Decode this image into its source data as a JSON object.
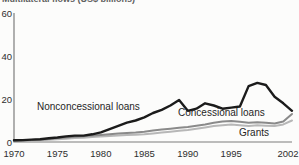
{
  "chart_data": {
    "type": "line",
    "title": "Multilateral flows (US$ billions)",
    "xlabel": "",
    "ylabel": "",
    "xlim": [
      1970,
      2002
    ],
    "ylim": [
      0,
      60
    ],
    "grid": false,
    "legend_position": "inline-labels",
    "axis_color": "#7d7d7d",
    "x_tick_years": [
      1970,
      1975,
      1980,
      1985,
      1990,
      1995,
      2002
    ],
    "x_tick_labels": [
      "1970",
      "1975",
      "1980",
      "1985",
      "1990",
      "1995",
      "2002"
    ],
    "y_tick_values": [
      0,
      20,
      40,
      60
    ],
    "y_tick_labels": [
      "0",
      "20",
      "40",
      "60"
    ],
    "x": [
      1970,
      1971,
      1972,
      1973,
      1974,
      1975,
      1976,
      1977,
      1978,
      1979,
      1980,
      1981,
      1982,
      1983,
      1984,
      1985,
      1986,
      1987,
      1988,
      1989,
      1990,
      1991,
      1992,
      1993,
      1994,
      1995,
      1996,
      1997,
      1998,
      1999,
      2000,
      2001,
      2002
    ],
    "series": [
      {
        "name": "Nonconcessional loans",
        "color": "#1b1b1b",
        "values": [
          0.8,
          0.9,
          1.1,
          1.3,
          1.7,
          2.1,
          2.6,
          3.0,
          3.0,
          3.6,
          4.5,
          6.0,
          7.5,
          9.0,
          10.0,
          11.5,
          13.5,
          15.0,
          17.0,
          19.5,
          14.5,
          15.5,
          18.0,
          17.0,
          15.5,
          16.0,
          16.5,
          26.0,
          27.5,
          26.5,
          21.0,
          18.0,
          14.5
        ]
      },
      {
        "name": "Concessional loans",
        "color": "#8a8a8a",
        "values": [
          0.5,
          0.7,
          0.9,
          1.1,
          1.4,
          1.8,
          2.1,
          2.4,
          2.7,
          3.0,
          3.3,
          3.6,
          3.9,
          4.2,
          4.4,
          4.8,
          5.3,
          5.8,
          6.2,
          6.6,
          7.0,
          7.6,
          8.2,
          9.0,
          9.6,
          9.8,
          9.4,
          9.0,
          9.2,
          9.0,
          8.6,
          9.5,
          13.0
        ]
      },
      {
        "name": "Grants",
        "color": "#b7b7b7",
        "values": [
          0.3,
          0.4,
          0.6,
          0.8,
          1.0,
          1.3,
          1.5,
          1.8,
          2.0,
          2.3,
          2.6,
          2.8,
          3.0,
          3.2,
          3.4,
          3.6,
          4.0,
          4.4,
          4.8,
          5.2,
          5.6,
          6.2,
          6.8,
          7.4,
          7.8,
          8.2,
          7.8,
          7.4,
          7.8,
          7.6,
          7.4,
          8.2,
          10.0
        ]
      }
    ]
  }
}
